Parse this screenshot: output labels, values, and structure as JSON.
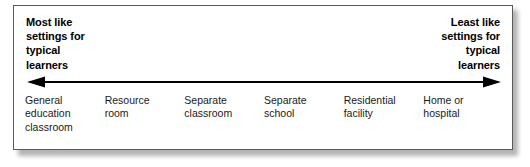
{
  "figure": {
    "name": "continuum-of-educational-placements",
    "anchors": {
      "left": {
        "text": "Most like\nsettings for\ntypical\nlearners",
        "align": "left"
      },
      "right": {
        "text": "Least like\nsettings for\ntypical\nlearners",
        "align": "right"
      }
    },
    "arrow": {
      "name": "double-headed-arrow",
      "direction": "both",
      "color": "#000000"
    },
    "placements": [
      {
        "label": "General\neducation\nclassroom"
      },
      {
        "label": "Resource\nroom"
      },
      {
        "label": "Separate\nclassroom"
      },
      {
        "label": "Separate\nschool"
      },
      {
        "label": "Residential\nfacility"
      },
      {
        "label": "Home or\nhospital"
      }
    ],
    "colors": {
      "background": "#ffffff",
      "border": "#5a5a5a",
      "text": "#000000",
      "label_text": "#1a1a1a",
      "shadow": "#9a9a9a"
    }
  }
}
